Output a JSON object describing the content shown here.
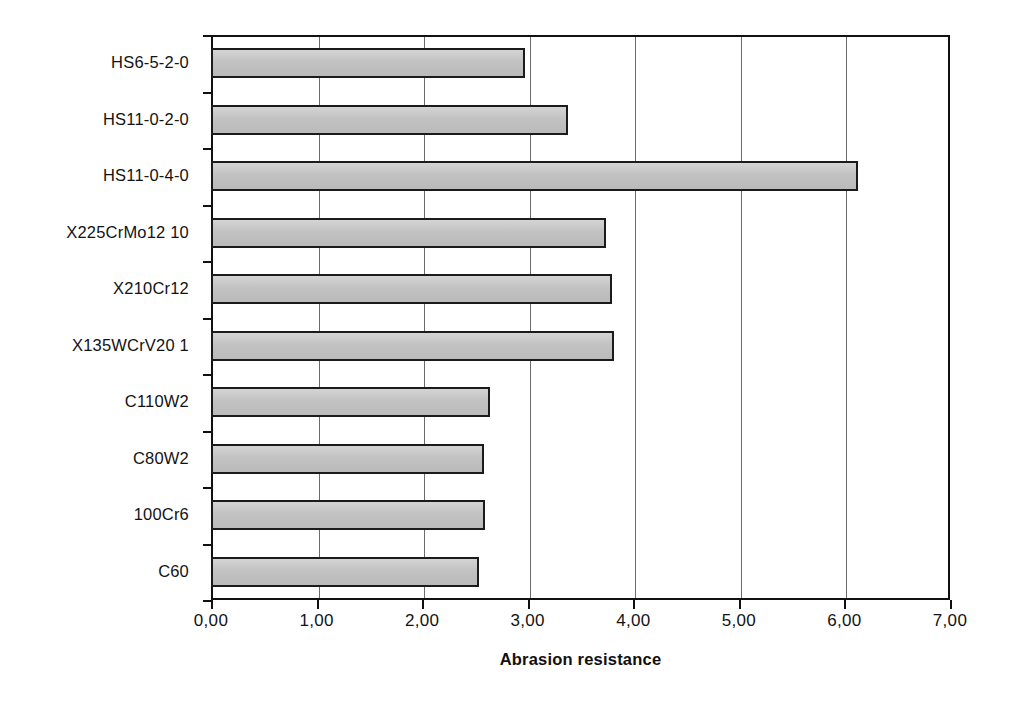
{
  "chart_data": {
    "type": "bar",
    "orientation": "horizontal",
    "title": "",
    "xlabel": "Abrasion resistance",
    "ylabel": "",
    "xlim": [
      0,
      7
    ],
    "ylim": null,
    "grid": true,
    "grid_axis": "x",
    "legend": false,
    "bar_fill_color": "#c2c2c2",
    "bar_edge_color": "#1b1b1b",
    "categories": [
      "HS6-5-2-0",
      "HS11-0-2-0",
      "HS11-0-4-0",
      "X225CrMo12 10",
      "X210Cr12",
      "X135WCrV20 1",
      "C110W2",
      "C80W2",
      "100Cr6",
      "C60"
    ],
    "values": [
      2.97,
      3.38,
      6.13,
      3.74,
      3.8,
      3.82,
      2.64,
      2.59,
      2.6,
      2.54
    ],
    "xticks": [
      0,
      1,
      2,
      3,
      4,
      5,
      6,
      7
    ],
    "xticklabels": [
      "0,00",
      "1,00",
      "2,00",
      "3,00",
      "4,00",
      "5,00",
      "6,00",
      "7,00"
    ]
  }
}
